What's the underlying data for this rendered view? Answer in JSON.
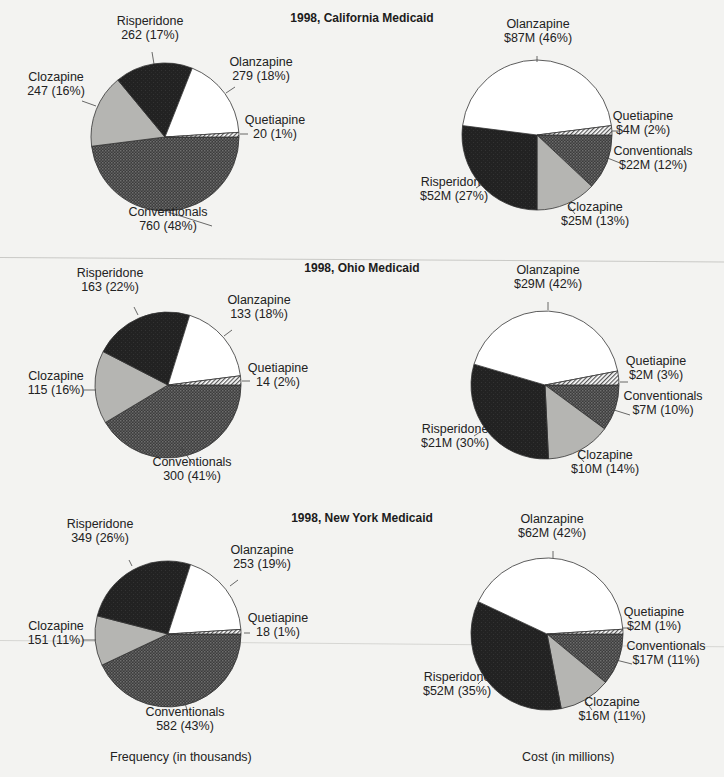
{
  "captions": {
    "left": "Frequency (in thousands)",
    "right": "Cost (in millions)"
  },
  "colors": {
    "background": "#f3f3f1",
    "olanzapine": "#ffffff",
    "risperidone": "#262626",
    "clozapine": "#b3b3b1",
    "conventionals": "#4a4a4a",
    "quetiapine": "hatch",
    "outline": "#333333"
  },
  "chart_data": [
    {
      "type": "pie",
      "title": "1998, California Medicaid",
      "subtitle": "Frequency (in thousands)",
      "slices": [
        {
          "label": "Conventionals",
          "value": 760,
          "percent": 48,
          "text": "760 (48%)"
        },
        {
          "label": "Clozapine",
          "value": 247,
          "percent": 16,
          "text": "247 (16%)"
        },
        {
          "label": "Risperidone",
          "value": 262,
          "percent": 17,
          "text": "262 (17%)"
        },
        {
          "label": "Olanzapine",
          "value": 279,
          "percent": 18,
          "text": "279 (18%)"
        },
        {
          "label": "Quetiapine",
          "value": 20,
          "percent": 1,
          "text": "20 (1%)"
        }
      ]
    },
    {
      "type": "pie",
      "title": "1998, California Medicaid",
      "subtitle": "Cost (in millions)",
      "slices": [
        {
          "label": "Conventionals",
          "value": 22,
          "percent": 12,
          "text": "$22M (12%)"
        },
        {
          "label": "Clozapine",
          "value": 25,
          "percent": 13,
          "text": "$25M (13%)"
        },
        {
          "label": "Risperidone",
          "value": 52,
          "percent": 27,
          "text": "$52M (27%)"
        },
        {
          "label": "Olanzapine",
          "value": 87,
          "percent": 46,
          "text": "$87M (46%)"
        },
        {
          "label": "Quetiapine",
          "value": 4,
          "percent": 2,
          "text": "$4M (2%)"
        }
      ]
    },
    {
      "type": "pie",
      "title": "1998, Ohio Medicaid",
      "subtitle": "Frequency (in thousands)",
      "slices": [
        {
          "label": "Conventionals",
          "value": 300,
          "percent": 41,
          "text": "300 (41%)"
        },
        {
          "label": "Clozapine",
          "value": 115,
          "percent": 16,
          "text": "115 (16%)"
        },
        {
          "label": "Risperidone",
          "value": 163,
          "percent": 22,
          "text": "163 (22%)"
        },
        {
          "label": "Olanzapine",
          "value": 133,
          "percent": 18,
          "text": "133 (18%)"
        },
        {
          "label": "Quetiapine",
          "value": 14,
          "percent": 2,
          "text": "14 (2%)"
        }
      ]
    },
    {
      "type": "pie",
      "title": "1998, Ohio Medicaid",
      "subtitle": "Cost (in millions)",
      "slices": [
        {
          "label": "Conventionals",
          "value": 7,
          "percent": 10,
          "text": "$7M (10%)"
        },
        {
          "label": "Clozapine",
          "value": 10,
          "percent": 14,
          "text": "$10M (14%)"
        },
        {
          "label": "Risperidone",
          "value": 21,
          "percent": 30,
          "text": "$21M (30%)"
        },
        {
          "label": "Olanzapine",
          "value": 29,
          "percent": 42,
          "text": "$29M (42%)"
        },
        {
          "label": "Quetiapine",
          "value": 2,
          "percent": 3,
          "text": "$2M (3%)"
        }
      ]
    },
    {
      "type": "pie",
      "title": "1998, New York Medicaid",
      "subtitle": "Frequency (in thousands)",
      "slices": [
        {
          "label": "Conventionals",
          "value": 582,
          "percent": 43,
          "text": "582 (43%)"
        },
        {
          "label": "Clozapine",
          "value": 151,
          "percent": 11,
          "text": "151 (11%)"
        },
        {
          "label": "Risperidone",
          "value": 349,
          "percent": 26,
          "text": "349 (26%)"
        },
        {
          "label": "Olanzapine",
          "value": 253,
          "percent": 19,
          "text": "253 (19%)"
        },
        {
          "label": "Quetiapine",
          "value": 18,
          "percent": 1,
          "text": "18 (1%)"
        }
      ]
    },
    {
      "type": "pie",
      "title": "1998, New York Medicaid",
      "subtitle": "Cost (in millions)",
      "slices": [
        {
          "label": "Conventionals",
          "value": 17,
          "percent": 11,
          "text": "$17M (11%)"
        },
        {
          "label": "Clozapine",
          "value": 16,
          "percent": 11,
          "text": "$16M (11%)"
        },
        {
          "label": "Risperidone",
          "value": 52,
          "percent": 35,
          "text": "$52M (35%)"
        },
        {
          "label": "Olanzapine",
          "value": 62,
          "percent": 42,
          "text": "$62M (42%)"
        },
        {
          "label": "Quetiapine",
          "value": 2,
          "percent": 1,
          "text": "$2M (1%)"
        }
      ]
    }
  ],
  "panels": [
    {
      "title": "1998, California Medicaid"
    },
    {
      "title": "1998, Ohio Medicaid"
    },
    {
      "title": "1998, New York Medicaid"
    }
  ]
}
